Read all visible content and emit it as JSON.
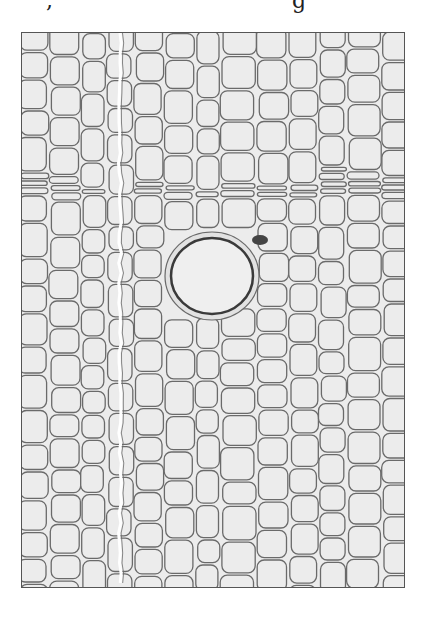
{
  "caption": {
    "fragment_left": ",",
    "fragment_right": "g"
  },
  "micrograph": {
    "subject": "wood-cross-section",
    "description": "Transverse section of softwood showing tracheid cells, a growth-ring boundary, a ray, and a central resin canal",
    "colors": {
      "background": "#ffffff",
      "cell_fill": "#ececec",
      "cell_wall": "#6a6a6a",
      "frame": "#555555",
      "canal_wall": "#3a3a3a"
    },
    "frame": {
      "x": 21,
      "y": 32,
      "width": 384,
      "height": 556
    },
    "resin_canal": {
      "cx": 211,
      "cy": 275,
      "rx": 41,
      "ry": 38
    },
    "growth_ring_band_y": [
      168,
      192
    ],
    "ray_x": 119
  }
}
